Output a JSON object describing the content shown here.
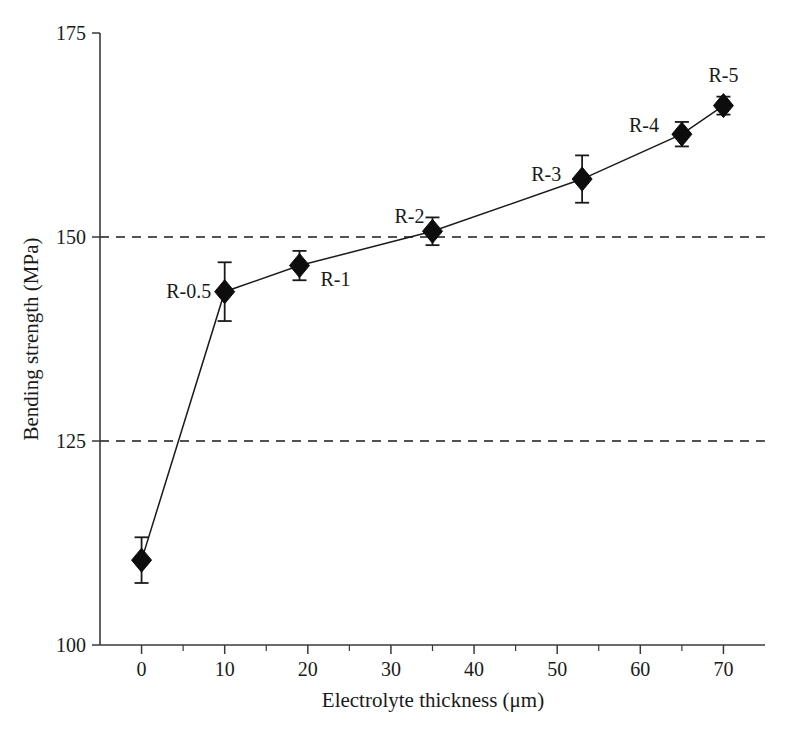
{
  "chart_data": {
    "type": "line",
    "title": "",
    "xlabel": "Electrolyte thickness (μm)",
    "ylabel": "Bending strength (MPa)",
    "xlim": [
      -5,
      75
    ],
    "ylim": [
      100,
      175
    ],
    "xticks": [
      0,
      10,
      20,
      30,
      40,
      50,
      60,
      70
    ],
    "xtick_labels": [
      "0",
      "10",
      "20",
      "30",
      "40",
      "50",
      "60",
      "70"
    ],
    "x_minor_ticks": [
      5,
      15,
      25,
      35,
      45,
      55,
      65
    ],
    "yticks": [
      100,
      125,
      150,
      175
    ],
    "ytick_labels": [
      "100",
      "125",
      "150",
      "175"
    ],
    "grid": "horizontal-dashed at 125 and 150",
    "gridlines": [
      125,
      150
    ],
    "legend": "none",
    "marker": "filled-diamond",
    "error_bars": "symmetric vertical",
    "x": [
      0,
      10,
      19,
      35,
      53,
      65,
      70
    ],
    "values": [
      110.4,
      143.3,
      146.5,
      150.7,
      157.1,
      162.6,
      166.1
    ],
    "yerr": [
      2.8,
      3.6,
      1.8,
      1.7,
      2.9,
      1.5,
      1.1
    ],
    "point_labels": [
      "",
      "R-0.5",
      "R-1",
      "R-2",
      "R-3",
      "R-4",
      "R-5"
    ],
    "point_label_positions": [
      "",
      "left",
      "right",
      "above-left",
      "left",
      "left",
      "above"
    ],
    "series": [
      {
        "name": "Bending strength",
        "points": [
          {
            "label": "",
            "x": 0,
            "y": 110.4,
            "err": 2.8
          },
          {
            "label": "R-0.5",
            "x": 10,
            "y": 143.3,
            "err": 3.6
          },
          {
            "label": "R-1",
            "x": 19,
            "y": 146.5,
            "err": 1.8
          },
          {
            "label": "R-2",
            "x": 35,
            "y": 150.7,
            "err": 1.7
          },
          {
            "label": "R-3",
            "x": 53,
            "y": 157.1,
            "err": 2.9
          },
          {
            "label": "R-4",
            "x": 65,
            "y": 162.6,
            "err": 1.5
          },
          {
            "label": "R-5",
            "x": 70,
            "y": 166.1,
            "err": 1.1
          }
        ]
      }
    ],
    "colors": {
      "line": "#1a1a1a",
      "marker": "#0d0d0d",
      "axis": "#3a3a3a",
      "grid": "#1a1a1a",
      "background": "#ffffff"
    }
  }
}
